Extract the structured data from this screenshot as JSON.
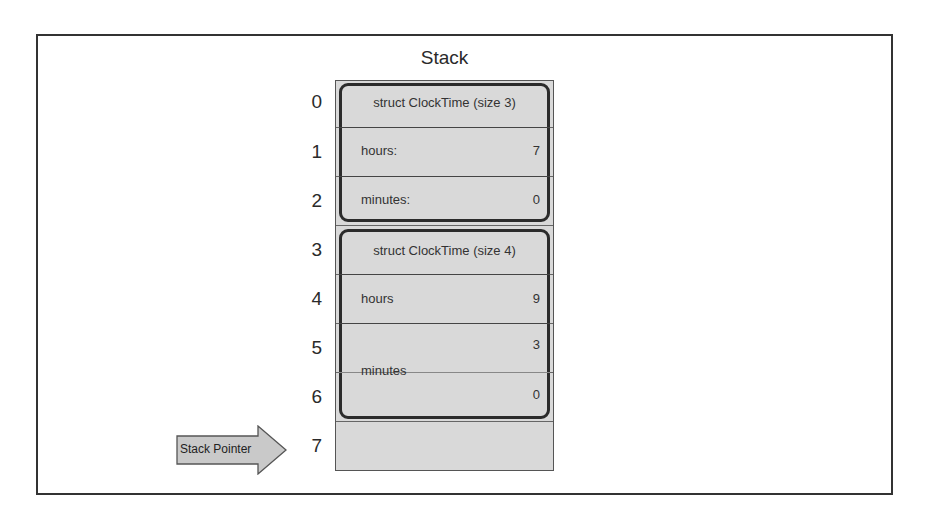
{
  "diagram": {
    "title": "Stack",
    "indices": [
      "0",
      "1",
      "2",
      "3",
      "4",
      "5",
      "6",
      "7"
    ],
    "structs": [
      {
        "header": "struct ClockTime (size 3)",
        "fields": [
          {
            "label": "hours:",
            "value": "7"
          },
          {
            "label": "minutes:",
            "value": "0"
          }
        ]
      },
      {
        "header": "struct ClockTime (size 4)",
        "fields": [
          {
            "label": "hours",
            "value": "9"
          },
          {
            "label": "minutes",
            "values": [
              "3",
              "0"
            ]
          }
        ]
      }
    ],
    "pointer": {
      "label": "Stack Pointer",
      "index": "7"
    },
    "colors": {
      "cell_fill": "#d9d9d9",
      "struct_border": "#2b2b2b",
      "frame_border": "#333333",
      "arrow_fill": "#c9c9c9"
    }
  }
}
